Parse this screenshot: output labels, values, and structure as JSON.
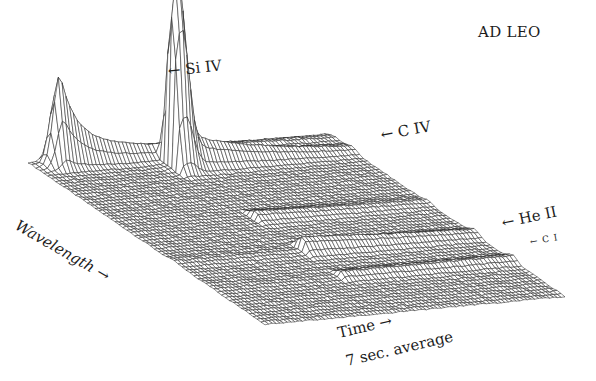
{
  "chart_data": {
    "type": "surface3d",
    "title": "AD LEO",
    "xlabel": "Wavelength →",
    "ylabel": "Time →",
    "subtitle": "7 sec. average",
    "annotations": [
      {
        "label": "Si IV",
        "arrow": "←",
        "position": "upper-left peak"
      },
      {
        "label": "C IV",
        "arrow": "←",
        "position": "central peak ridge"
      },
      {
        "label": "He II",
        "arrow": "←",
        "position": "right edge ridge"
      },
      {
        "label": "C I",
        "arrow": "←",
        "position": "right edge small ridge"
      }
    ],
    "grid": true,
    "style": "wireframe mesh, black on white",
    "lines": [
      {
        "name": "Si IV",
        "wavelength_frac": 0.12,
        "peak_time_frac": 0.1,
        "peak_height": 0.75,
        "decay": 0.35,
        "baseline_after": 0.18
      },
      {
        "name": "C IV",
        "wavelength_frac": 0.12,
        "peak_time_frac": 0.55,
        "peak_height": 1.0,
        "decay": 0.25,
        "baseline_after": 0.2
      },
      {
        "name": "He II",
        "wavelength_frac": 0.62,
        "peak_time_frac": 0.7,
        "peak_height": 0.12,
        "decay": 0.5,
        "baseline_after": 0.05
      },
      {
        "name": "C I",
        "wavelength_frac": 0.82,
        "peak_time_frac": 0.7,
        "peak_height": 0.05,
        "decay": 0.5,
        "baseline_after": 0.02
      }
    ],
    "legend_position": "none"
  },
  "labels": {
    "title": "AD LEO",
    "si_iv": "← Si IV",
    "c_iv": "← C IV",
    "he_ii": "← He II",
    "c_i": "← C I",
    "wavelength": "Wavelength →",
    "time": "Time →",
    "average": "7 sec. average"
  }
}
